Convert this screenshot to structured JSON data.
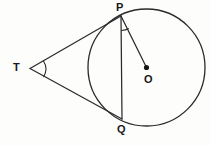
{
  "figure": {
    "type": "geometry-diagram",
    "background_color": "#fdfdfc",
    "stroke_color": "#2a2a2d",
    "label_color": "#17171a",
    "width": 211,
    "height": 146
  },
  "circle": {
    "name": "circle-o",
    "center_x": 146.5,
    "center_y": 67.5,
    "radius": 58.5,
    "stroke_width": 1.3
  },
  "points": {
    "P": {
      "label": "P",
      "x": 121,
      "y": 16,
      "marker": "none"
    },
    "T": {
      "label": "T",
      "x": 30,
      "y": 68.5,
      "marker": "none"
    },
    "O": {
      "label": "O",
      "x": 146.5,
      "y": 67.5,
      "marker": "dot",
      "dot_radius": 2.6
    },
    "Q": {
      "label": "Q",
      "x": 122,
      "y": 119,
      "marker": "none"
    }
  },
  "segments": [
    {
      "name": "tangent-TP",
      "from": "T",
      "to": "P",
      "x1": 30,
      "y1": 68.5,
      "x2": 121,
      "y2": 16
    },
    {
      "name": "tangent-TQ",
      "from": "T",
      "to": "Q",
      "x1": 30,
      "y1": 68.5,
      "x2": 122,
      "y2": 119
    },
    {
      "name": "chord-PQ",
      "from": "P",
      "to": "Q",
      "x1": 121,
      "y1": 16,
      "x2": 122,
      "y2": 119
    },
    {
      "name": "radius-OP",
      "from": "P",
      "to": "O",
      "x1": 121,
      "y1": 16,
      "x2": 146.5,
      "y2": 67.5
    }
  ],
  "angle_arcs": [
    {
      "name": "angle-arc-at-T",
      "vertex": "T",
      "path": "M 43.3 60.8 A 15 15 0 0 1 43.5 77.0"
    },
    {
      "name": "angle-arc-at-P",
      "vertex": "P",
      "path": "M 121.2 30 A 14 14 0 0 0 128.4 28.2"
    }
  ],
  "labels": {
    "p": "P",
    "t": "T",
    "o": "O",
    "q": "Q"
  }
}
